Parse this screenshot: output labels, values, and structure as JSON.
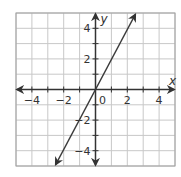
{
  "chart_data": {
    "type": "line",
    "title": "",
    "xlabel": "x",
    "ylabel": "y",
    "xlim": [
      -5,
      5
    ],
    "ylim": [
      -5,
      5
    ],
    "grid": true,
    "grid_step": 1,
    "x_ticks": [
      -4,
      -2,
      0,
      2,
      4
    ],
    "y_ticks": [
      -4,
      -2,
      2,
      4
    ],
    "x_tick_labels": [
      "−4",
      "−2",
      "0",
      "2",
      "4"
    ],
    "y_tick_labels": [
      "−4",
      "−2",
      "2",
      "4"
    ],
    "series": [
      {
        "name": "y = 2x",
        "equation": "y = 2x",
        "x": [
          -2.5,
          -2,
          -1,
          0,
          1,
          2,
          2.5
        ],
        "y": [
          -5,
          -4,
          -2,
          0,
          2,
          4,
          5
        ],
        "arrows_both_ends": true
      }
    ],
    "axes_arrows": true,
    "legend": null
  },
  "colors": {
    "grid": "#c8c8c8",
    "axis": "#333333",
    "line": "#3a3a3a",
    "border": "#a0a0a0"
  }
}
